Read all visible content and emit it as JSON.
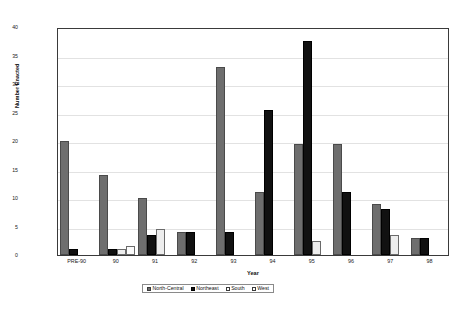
{
  "chart_data": {
    "type": "bar",
    "title": "",
    "xlabel": "Year",
    "ylabel": "Number Enacted",
    "ylim": [
      0,
      40
    ],
    "yticks": [
      40,
      35,
      30,
      25,
      20,
      15,
      10,
      5,
      0
    ],
    "grid": true,
    "legend_position": "bottom",
    "categories": [
      "PRE-90",
      "90",
      "91",
      "92",
      "93",
      "94",
      "95",
      "96",
      "97",
      "98"
    ],
    "series": [
      {
        "name": "North-Central",
        "color": "#6e6e6e",
        "values": [
          20,
          14,
          10,
          4,
          33,
          11,
          19.5,
          19.5,
          9,
          3
        ]
      },
      {
        "name": "Northeast",
        "color": "#111111",
        "values": [
          1,
          1,
          3.5,
          4,
          4,
          25.5,
          37.5,
          11,
          8,
          3
        ]
      },
      {
        "name": "South",
        "color": "#ffffff",
        "values": [
          0,
          1,
          4.5,
          0,
          0,
          0,
          2.5,
          0,
          3.5,
          0
        ]
      },
      {
        "name": "West",
        "color": "#ffffff",
        "values": [
          0,
          1.5,
          0,
          0,
          0,
          0,
          0,
          0,
          0,
          0
        ]
      }
    ]
  },
  "caption": "",
  "legend": {
    "items": [
      {
        "label": "North-Central"
      },
      {
        "label": "Northeast"
      },
      {
        "label": "South"
      },
      {
        "label": "West"
      }
    ]
  }
}
